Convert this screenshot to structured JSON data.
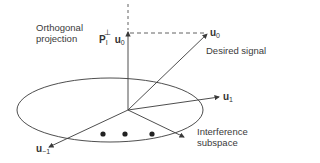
{
  "diagram": {
    "labels": {
      "projection_line1": "Orthogonal",
      "projection_line2": "projection",
      "projection_symbol": "P",
      "projection_sub": "I",
      "projection_sup": "⊥",
      "projection_vec": "u",
      "projection_vec_sub": "0",
      "desired_vec": "u",
      "desired_vec_sub": "0",
      "desired_caption": "Desired signal",
      "u1_vec": "u",
      "u1_sub": "1",
      "um1_vec": "u",
      "um1_sub": "−1",
      "interference_line1": "Interference",
      "interference_line2": "subspace"
    },
    "colors": {
      "stroke": "#3a3a3a",
      "background": "#ffffff"
    }
  }
}
